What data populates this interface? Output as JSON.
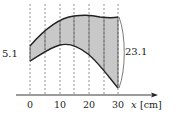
{
  "figure": {
    "type": "cross-section diagram with vertical slices",
    "left_label": "5.1",
    "right_label": "23.1",
    "axis": {
      "variable": "x",
      "unit": "[cm]",
      "ticks": [
        "0",
        "10",
        "20",
        "30"
      ]
    },
    "slice_positions_cm": [
      0,
      5,
      10,
      15,
      20,
      25,
      30
    ],
    "colors": {
      "fill": "#c8c8c8",
      "outline": "#222222",
      "dashed": "#666666"
    }
  }
}
